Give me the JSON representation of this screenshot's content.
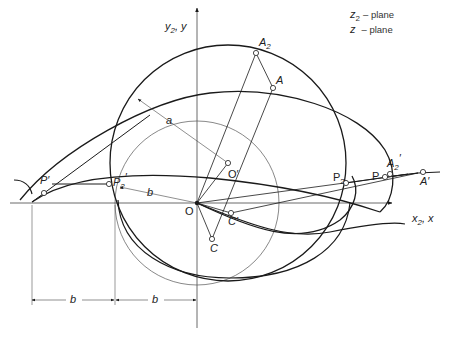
{
  "legend": {
    "line1_var": "z",
    "line1_sub": "2",
    "line1_text": "– plane",
    "line2_var": "z",
    "line2_text": "– plane"
  },
  "axes": {
    "x_label": "x",
    "x_label_sub": "2",
    "x_label_suffix": ", x",
    "y_label": "y",
    "y_label_sub": "2",
    "y_label_suffix": ", y"
  },
  "points": {
    "A2": {
      "name": "A",
      "sub": "2",
      "prime": ""
    },
    "A": {
      "name": "A",
      "sub": "",
      "prime": ""
    },
    "A2p": {
      "name": "A",
      "sub": "2",
      "prime": "′"
    },
    "Ap": {
      "name": "A",
      "sub": "",
      "prime": "′"
    },
    "P2": {
      "name": "P",
      "sub": "2",
      "prime": ""
    },
    "P": {
      "name": "P",
      "sub": "",
      "prime": ""
    },
    "P2p": {
      "name": "P",
      "sub": "2",
      "prime": "′"
    },
    "Pp": {
      "name": "P",
      "sub": "",
      "prime": "′"
    },
    "O": {
      "name": "O"
    },
    "Op": {
      "name": "O′"
    },
    "C": {
      "name": "C"
    },
    "Cp": {
      "name": "C′"
    }
  },
  "dimensions": {
    "radius_a": "a",
    "radius_b": "b",
    "dim_left": "b",
    "dim_right": "b"
  },
  "colors": {
    "heavy": "#1a1a1a",
    "light": "#555555"
  }
}
